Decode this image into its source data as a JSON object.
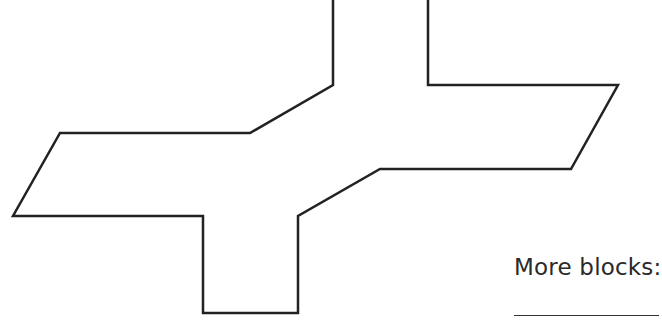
{
  "figure": {
    "shape_name": "cross-shaped polygon outline",
    "stroke_color": "#222222",
    "fill_color": "#ffffff",
    "points": [
      [
        333,
        0
      ],
      [
        333,
        85
      ],
      [
        250,
        133
      ],
      [
        60,
        133
      ],
      [
        13,
        216
      ],
      [
        203,
        216
      ],
      [
        203,
        313
      ],
      [
        298,
        313
      ],
      [
        298,
        216
      ],
      [
        380,
        169
      ],
      [
        571,
        169
      ],
      [
        618,
        85
      ],
      [
        428,
        85
      ],
      [
        428,
        0
      ]
    ]
  },
  "prompt": {
    "label": "More blocks:",
    "answer_value": ""
  }
}
